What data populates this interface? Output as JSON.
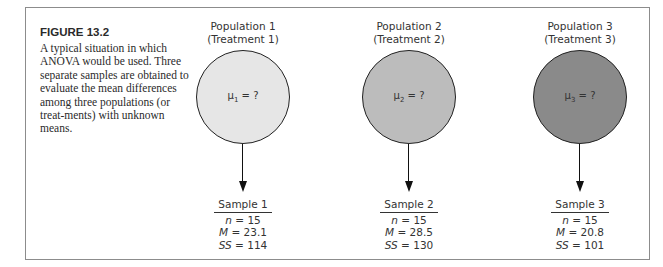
{
  "figure": {
    "label": "FIGURE 13.2",
    "caption": "A typical situation in which ANOVA would be used. Three separate samples are obtained to evaluate the mean differences among three populations (or treat-ments) with unknown means."
  },
  "colors": {
    "population_1": "#e6e6e6",
    "population_2": "#bcbcbc",
    "population_3": "#8a8a8a",
    "border": "#8c8c8c"
  },
  "populations": [
    {
      "title": "Population 1",
      "subtitle": "(Treatment 1)",
      "mu_symbol": "μ",
      "mu_sub": "1",
      "mu_value": " = ?",
      "sample": {
        "title": "Sample 1",
        "n_label": "n",
        "n": "= 15",
        "M_label": "M",
        "M": "= 23.1",
        "SS_label": "SS",
        "SS": "= 114"
      }
    },
    {
      "title": "Population 2",
      "subtitle": "(Treatment 2)",
      "mu_symbol": "μ",
      "mu_sub": "2",
      "mu_value": " = ?",
      "sample": {
        "title": "Sample 2",
        "n_label": "n",
        "n": "= 15",
        "M_label": "M",
        "M": "= 28.5",
        "SS_label": "SS",
        "SS": "= 130"
      }
    },
    {
      "title": "Population 3",
      "subtitle": "(Treatment 3)",
      "mu_symbol": "μ",
      "mu_sub": "3",
      "mu_value": " = ?",
      "sample": {
        "title": "Sample 3",
        "n_label": "n",
        "n": "= 15",
        "M_label": "M",
        "M": "= 20.8",
        "SS_label": "SS",
        "SS": "= 101"
      }
    }
  ]
}
